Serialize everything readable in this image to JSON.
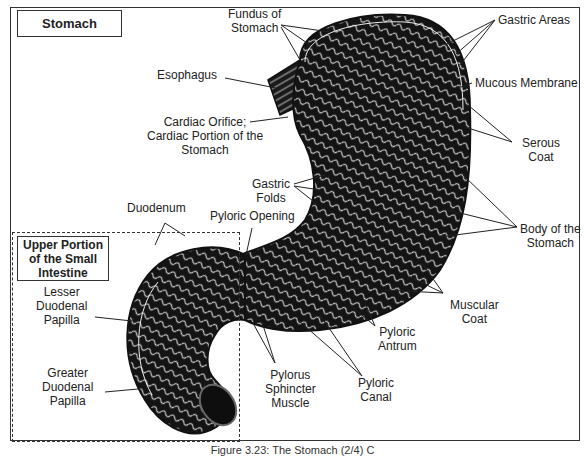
{
  "figure": {
    "title": "Stomach",
    "section_title": "Upper Portion\nof the Small\nIntestine",
    "caption": "Figure 3.23: The Stomach (2/4) C"
  },
  "labels": {
    "fundus": "Fundus of\nStomach",
    "gastric_areas": "Gastric Areas",
    "esophagus": "Esophagus",
    "mucous_membrane": "Mucous Membrane",
    "cardiac_orifice": "Cardiac Orifice;\nCardiac Portion of the\nStomach",
    "serous_coat": "Serous\nCoat",
    "gastric_folds": "Gastric\nFolds",
    "duodenum": "Duodenum",
    "pyloric_opening": "Pyloric Opening",
    "body_of_stomach": "Body of the\nStomach",
    "lesser_duodenal_papilla": "Lesser\nDuodenal\nPapilla",
    "muscular_coat": "Muscular\nCoat",
    "pyloric_antrum": "Pyloric\nAntrum",
    "greater_duodenal_papilla": "Greater\nDuodenal\nPapilla",
    "pylorus_sphincter_muscle": "Pylorus\nSphincter\nMuscle",
    "pyloric_canal": "Pyloric\nCanal"
  },
  "colors": {
    "ink": "#1a1a1a",
    "tissue_dark": "#141414",
    "tissue_light": "#e8e8e8",
    "background": "#ffffff"
  }
}
